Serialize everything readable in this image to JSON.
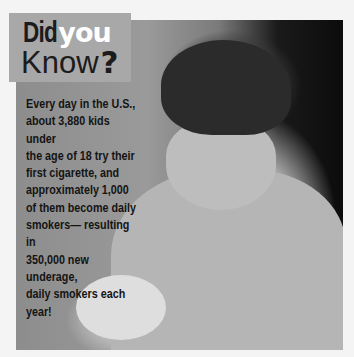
{
  "title": {
    "word1": "Did",
    "word2": "you",
    "word3": "Know",
    "mark": "?"
  },
  "fact": {
    "lines": [
      "Every day in the U.S.,",
      "about 3,880 kids under",
      "the age of 18 try their",
      "first cigarette, and",
      "approximately 1,000",
      "of them become daily",
      "smokers— resulting in",
      "350,000 new underage,",
      "daily smokers each",
      "year!"
    ]
  },
  "photo": {
    "subject": "teenage boy in hoodie lighting a cigarette"
  },
  "colors": {
    "title_box": "#a8a8a8",
    "title_dark": "#1c1c1c",
    "title_light": "#ffffff",
    "background": "#f4f4f4"
  }
}
